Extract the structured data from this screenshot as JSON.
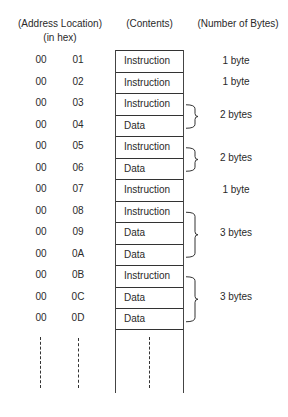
{
  "headers": {
    "address_line1": "(Address Location)",
    "address_line2": "(in hex)",
    "contents": "(Contents)",
    "bytes": "(Number of Bytes)"
  },
  "rows": [
    {
      "hi": "00",
      "lo": "01",
      "content": "Instruction"
    },
    {
      "hi": "00",
      "lo": "02",
      "content": "Instruction"
    },
    {
      "hi": "00",
      "lo": "03",
      "content": "Instruction"
    },
    {
      "hi": "00",
      "lo": "04",
      "content": "Data"
    },
    {
      "hi": "00",
      "lo": "05",
      "content": "Instruction"
    },
    {
      "hi": "00",
      "lo": "06",
      "content": "Data"
    },
    {
      "hi": "00",
      "lo": "07",
      "content": "Instruction"
    },
    {
      "hi": "00",
      "lo": "08",
      "content": "Instruction"
    },
    {
      "hi": "00",
      "lo": "09",
      "content": "Data"
    },
    {
      "hi": "00",
      "lo": "0A",
      "content": "Data"
    },
    {
      "hi": "00",
      "lo": "0B",
      "content": "Instruction"
    },
    {
      "hi": "00",
      "lo": "0C",
      "content": "Data"
    },
    {
      "hi": "00",
      "lo": "0D",
      "content": "Data"
    }
  ],
  "groups": [
    {
      "label": "1 byte",
      "start_row": 0,
      "span": 1,
      "brace": false
    },
    {
      "label": "1 byte",
      "start_row": 1,
      "span": 1,
      "brace": false
    },
    {
      "label": "2 bytes",
      "start_row": 2,
      "span": 2,
      "brace": true
    },
    {
      "label": "2 bytes",
      "start_row": 4,
      "span": 2,
      "brace": true
    },
    {
      "label": "1 byte",
      "start_row": 6,
      "span": 1,
      "brace": false
    },
    {
      "label": "3 bytes",
      "start_row": 7,
      "span": 3,
      "brace": true
    },
    {
      "label": "3 bytes",
      "start_row": 10,
      "span": 3,
      "brace": true
    }
  ],
  "continuation": "dashed lines indicate memory continues"
}
